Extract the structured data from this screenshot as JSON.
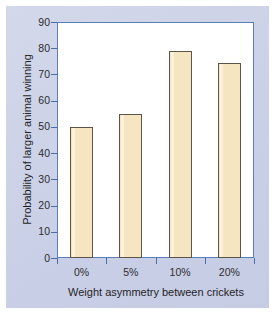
{
  "figure": {
    "panel_color": "#ccd2e8",
    "plot_background": "#ffffff",
    "frame_color": "#5a7fb8"
  },
  "chart_data": {
    "type": "bar",
    "title": "",
    "xlabel": "Weight asymmetry between crickets",
    "ylabel": "Probability of larger animal winning",
    "categories": [
      "0%",
      "5%",
      "10%",
      "20%"
    ],
    "values": [
      50,
      55,
      79,
      74.5
    ],
    "ylim": [
      0,
      90
    ],
    "yticks": [
      0,
      10,
      20,
      30,
      40,
      50,
      60,
      70,
      80,
      90
    ],
    "ytick_labels": [
      "0",
      "10",
      "20",
      "30",
      "40",
      "50",
      "60",
      "70",
      "80",
      "90"
    ],
    "grid": false,
    "legend": false,
    "bar_color": "#f6e5c1",
    "bar_edge_color": "#5d544a"
  }
}
